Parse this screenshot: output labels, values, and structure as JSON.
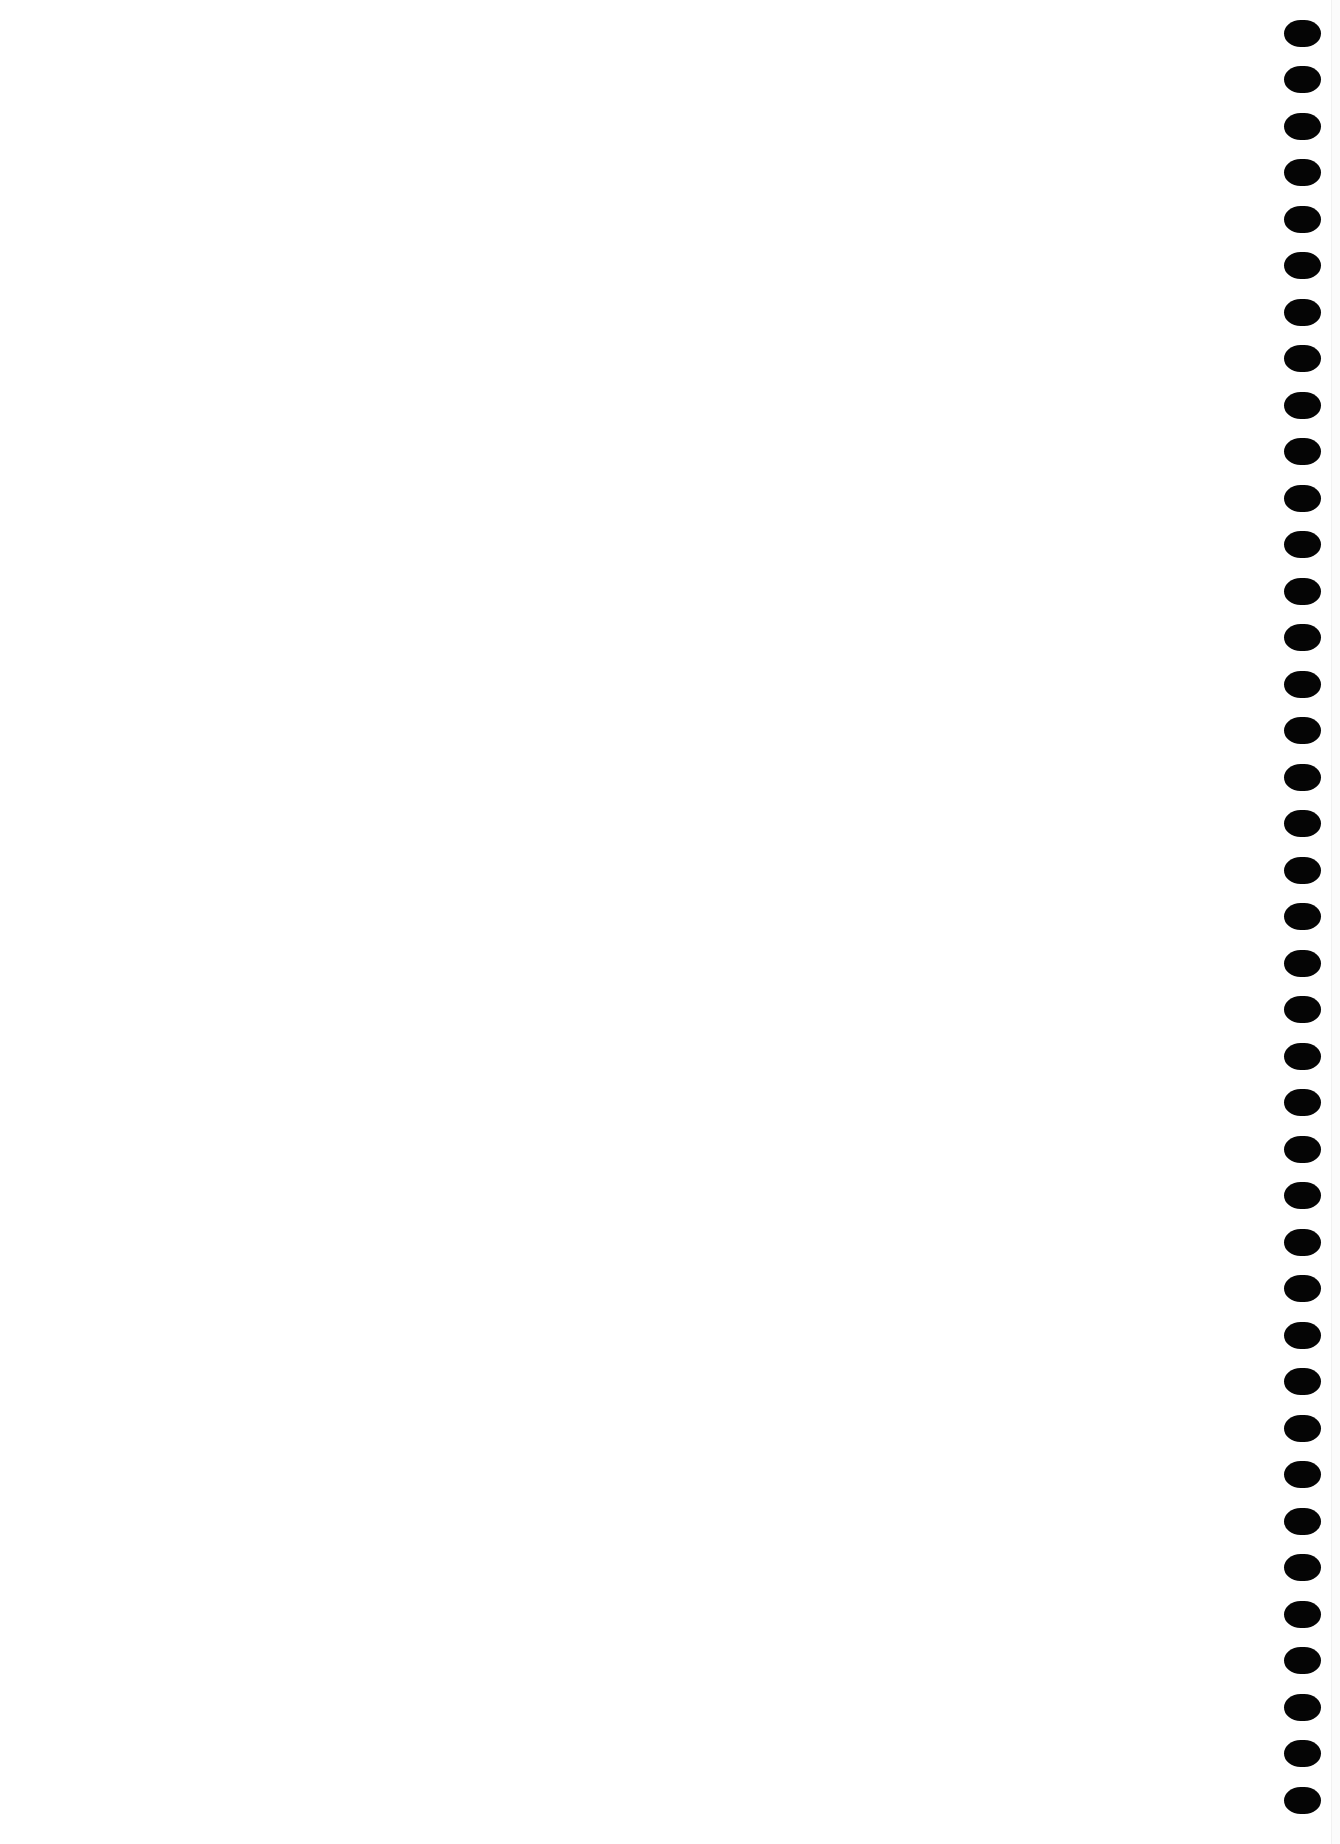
{
  "document": {
    "type": "blank notebook page",
    "background_color": "#ffffff",
    "binding": {
      "side": "right",
      "hole_count": 39,
      "hole_color": "#050505",
      "first_hole_center_y": 33,
      "last_hole_center_y": 1800,
      "hole_center_x": 1302
    }
  }
}
